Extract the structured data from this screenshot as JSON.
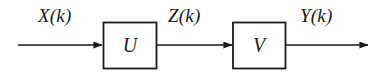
{
  "diagram": {
    "type": "block-diagram",
    "background_color": "#ffffff",
    "stroke_color": "#1a1a1a",
    "signals": [
      {
        "id": "input",
        "label": "X(k)"
      },
      {
        "id": "intermediate",
        "label": "Z(k)"
      },
      {
        "id": "output",
        "label": "Y(k)"
      }
    ],
    "blocks": [
      {
        "id": "block-u",
        "label": "U"
      },
      {
        "id": "block-v",
        "label": "V"
      }
    ],
    "arrows": [
      {
        "id": "arrow-input",
        "from": "source",
        "to": "block-u"
      },
      {
        "id": "arrow-middle",
        "from": "block-u",
        "to": "block-v"
      },
      {
        "id": "arrow-output",
        "from": "block-v",
        "to": "sink"
      }
    ]
  }
}
